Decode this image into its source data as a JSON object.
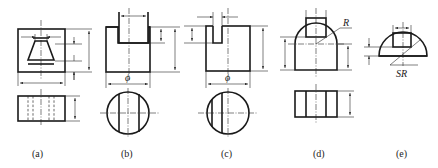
{
  "figure": {
    "line_color": "#1a1a1a",
    "background": "#ffffff",
    "panels": [
      {
        "id": "a",
        "caption": "(a)"
      },
      {
        "id": "b",
        "caption": "(b)",
        "dim_symbol": "ϕ"
      },
      {
        "id": "c",
        "caption": "(c)",
        "dim_symbol": "ϕ"
      },
      {
        "id": "d",
        "caption": "(d)",
        "dim_symbol": "R"
      },
      {
        "id": "e",
        "caption": "(e)",
        "dim_symbol": "SR"
      }
    ]
  }
}
